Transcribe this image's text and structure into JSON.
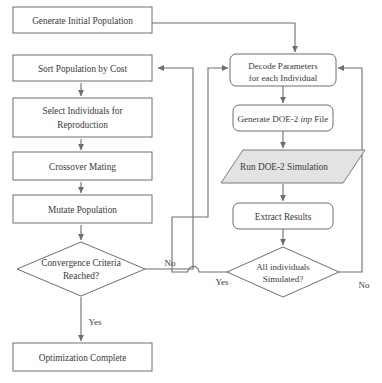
{
  "diagram": {
    "type": "flowchart",
    "colors": {
      "stroke": "#6e6e6e",
      "text": "#3a3a3a",
      "background": "#ffffff",
      "shaded_fill": "#e3e3e3"
    },
    "nodes": [
      {
        "id": "generate-initial-population",
        "shape": "rectangle",
        "label": "Generate Initial Population",
        "lines": [
          "Generate Initial Population"
        ]
      },
      {
        "id": "sort-population-by-cost",
        "shape": "rectangle",
        "label": "Sort Population by Cost",
        "lines": [
          "Sort Population by Cost"
        ]
      },
      {
        "id": "select-individuals-for-reproduction",
        "shape": "rectangle",
        "label": "Select Individuals for Reproduction",
        "lines": [
          "Select Individuals for",
          "Reproduction"
        ]
      },
      {
        "id": "crossover-mating",
        "shape": "rectangle",
        "label": "Crossover Mating",
        "lines": [
          "Crossover Mating"
        ]
      },
      {
        "id": "mutate-population",
        "shape": "rectangle",
        "label": "Mutate Population",
        "lines": [
          "Mutate Population"
        ]
      },
      {
        "id": "convergence-criteria-reached",
        "shape": "diamond",
        "label": "Convergence Criteria Reached?",
        "lines": [
          "Convergence Criteria",
          "Reached?"
        ]
      },
      {
        "id": "optimization-complete",
        "shape": "rectangle",
        "label": "Optimization Complete",
        "lines": [
          "Optimization Complete"
        ]
      },
      {
        "id": "decode-parameters-for-each-individual",
        "shape": "rounded-rectangle",
        "label": "Decode Parameters for each Individual",
        "lines": [
          "Decode Parameters",
          "for each Individual"
        ]
      },
      {
        "id": "generate-doe2-inp-file",
        "shape": "rounded-rectangle",
        "label": "Generate DOE-2 inp File",
        "parts": [
          {
            "text": "Generate DOE-2 ",
            "italic": false
          },
          {
            "text": "inp",
            "italic": true
          },
          {
            "text": " File",
            "italic": false
          }
        ]
      },
      {
        "id": "run-doe2-simulation",
        "shape": "parallelogram",
        "shaded": true,
        "label": "Run DOE-2 Simulation",
        "lines": [
          "Run DOE-2 Simulation"
        ]
      },
      {
        "id": "extract-results",
        "shape": "rounded-rectangle",
        "label": "Extract Results",
        "lines": [
          "Extract Results"
        ]
      },
      {
        "id": "all-individuals-simulated",
        "shape": "diamond",
        "label": "All individuals Simulated?",
        "lines": [
          "All individuals",
          "Simulated?"
        ]
      }
    ],
    "edge_labels": {
      "convergence_no": "No",
      "convergence_yes": "Yes",
      "simulated_yes": "Yes",
      "simulated_no": "No"
    },
    "edges": [
      {
        "from": "generate-initial-population",
        "to": "decode-parameters-for-each-individual",
        "label": ""
      },
      {
        "from": "sort-population-by-cost",
        "to": "select-individuals-for-reproduction",
        "label": ""
      },
      {
        "from": "select-individuals-for-reproduction",
        "to": "crossover-mating",
        "label": ""
      },
      {
        "from": "crossover-mating",
        "to": "mutate-population",
        "label": ""
      },
      {
        "from": "mutate-population",
        "to": "convergence-criteria-reached",
        "label": ""
      },
      {
        "from": "convergence-criteria-reached",
        "to": "optimization-complete",
        "label": "Yes"
      },
      {
        "from": "convergence-criteria-reached",
        "to": "decode-parameters-for-each-individual",
        "label": "No"
      },
      {
        "from": "decode-parameters-for-each-individual",
        "to": "generate-doe2-inp-file",
        "label": ""
      },
      {
        "from": "generate-doe2-inp-file",
        "to": "run-doe2-simulation",
        "label": ""
      },
      {
        "from": "run-doe2-simulation",
        "to": "extract-results",
        "label": ""
      },
      {
        "from": "extract-results",
        "to": "all-individuals-simulated",
        "label": ""
      },
      {
        "from": "all-individuals-simulated",
        "to": "sort-population-by-cost",
        "label": "Yes"
      },
      {
        "from": "all-individuals-simulated",
        "to": "decode-parameters-for-each-individual",
        "label": "No"
      }
    ]
  }
}
